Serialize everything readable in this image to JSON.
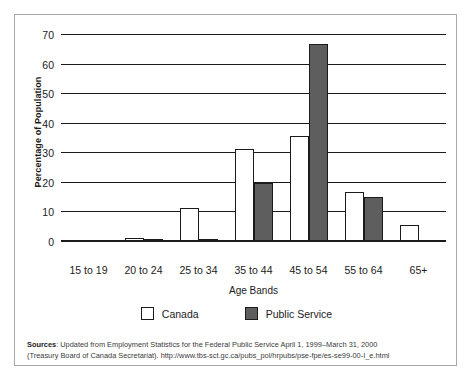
{
  "chart_data": {
    "type": "bar",
    "title": "",
    "xlabel": "Age Bands",
    "ylabel": "Percentage of Population",
    "ylim": [
      0,
      70
    ],
    "ytick_step": 10,
    "yticks": [
      70,
      60,
      50,
      40,
      30,
      20,
      10,
      0
    ],
    "grid": true,
    "legend_position": "bottom",
    "categories": [
      "15 to 19",
      "20 to 24",
      "25 to 34",
      "35 to 44",
      "45 to 54",
      "55 to 64",
      "65+"
    ],
    "series": [
      {
        "name": "Canada",
        "color": "#ffffff",
        "values": [
          0,
          1,
          11,
          31,
          35.5,
          16.5,
          5.5
        ]
      },
      {
        "name": "Public Service",
        "color": "#5e5e5e",
        "values": [
          0,
          0.5,
          0.8,
          19.5,
          66.5,
          15,
          0
        ]
      }
    ]
  },
  "legend": {
    "items": [
      {
        "label": "Canada",
        "swatch": "canada"
      },
      {
        "label": "Public Service",
        "swatch": "ps"
      }
    ]
  },
  "source": {
    "prefix": "Sources",
    "line1": ": Updated from Employment Statistics for the Federal Public Service April 1, 1999–March 31, 2000",
    "line2": "(Treasury Board of Canada Secretariat). http://www.tbs-sct.gc.ca/pubs_pol/hrpubs/pse-fpe/es-se99-00-I_e.html"
  }
}
